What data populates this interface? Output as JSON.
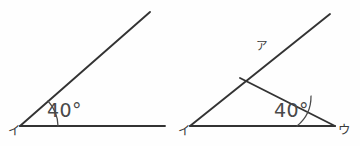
{
  "page": {
    "background_color": "#fefefe",
    "ink_color": "#333333",
    "width": 360,
    "height": 146
  },
  "figures": [
    {
      "id": "left-figure",
      "name": "given-angle-figure",
      "description": "A single 40 degree angle with a horizontal ray and an upward ray",
      "vertex_label": "イ",
      "angle_label": "40°",
      "angle_value": 40,
      "angle_unit": "degrees"
    },
    {
      "id": "right-figure",
      "name": "triangle-construction-figure",
      "description": "A construction with two crossing rays forming a 40 degree angle at the right vertex",
      "vertex_label_left": "イ",
      "vertex_label_right": "ウ",
      "crossing_point_label": "ア",
      "angle_label": "40°",
      "angle_value": 40,
      "angle_unit": "degrees"
    }
  ],
  "labels": {
    "left_vertex_i": "イ",
    "left_angle": "40°",
    "right_vertex_i": "イ",
    "right_vertex_u": "ウ",
    "right_point_a": "ア",
    "right_angle": "40°"
  }
}
